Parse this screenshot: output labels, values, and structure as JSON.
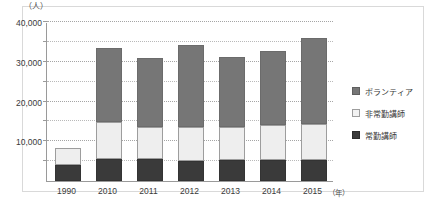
{
  "chart_data": {
    "type": "bar",
    "stacked": true,
    "title": "",
    "xlabel": "年",
    "ylabel": "人",
    "y_unit_label": "（人）",
    "x_unit_label": "（年）",
    "categories": [
      "1990",
      "2010",
      "2011",
      "2012",
      "2013",
      "2014",
      "2015"
    ],
    "series": [
      {
        "name": "常勤講師",
        "key": "full",
        "color": "#3a3a3a",
        "values": [
          4000,
          5500,
          5500,
          5000,
          5300,
          5200,
          5400
        ]
      },
      {
        "name": "非常勤講師",
        "key": "part",
        "color": "#eeeeee",
        "values": [
          4300,
          9400,
          8000,
          8600,
          8200,
          8800,
          9000
        ]
      },
      {
        "name": "ボランティア",
        "key": "vol",
        "color": "#767676",
        "values": [
          0,
          18500,
          17500,
          20700,
          17600,
          18800,
          21600
        ]
      }
    ],
    "totals": [
      8300,
      33400,
      31000,
      34300,
      31100,
      32800,
      36000
    ],
    "ylim": [
      0,
      40000
    ],
    "yticks": [
      0,
      5000,
      10000,
      15000,
      20000,
      25000,
      30000,
      35000,
      40000
    ],
    "ytick_labels_major": [
      "10,000",
      "20,000",
      "30,000",
      "40,000"
    ],
    "ymajor_values": [
      10000,
      20000,
      30000,
      40000
    ],
    "grid": true,
    "grid_interval": 5000,
    "legend_position": "right"
  },
  "legend": {
    "items": [
      {
        "label": "ボランティア",
        "swatch": "vol"
      },
      {
        "label": "非常勤講師",
        "swatch": "part"
      },
      {
        "label": "常勤講師",
        "swatch": "full"
      }
    ]
  },
  "axis": {
    "y_unit": "（人）",
    "x_unit": "（年）"
  },
  "caption": ""
}
